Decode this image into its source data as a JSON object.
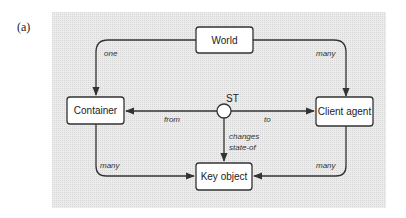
{
  "figure": {
    "label": "(a)",
    "panel_color": "#e6e6e6"
  },
  "nodes": {
    "world": "World",
    "container": "Container",
    "client_agent": "Client agent",
    "key_object": "Key object",
    "st": "ST"
  },
  "edges": {
    "world_container": "one",
    "world_client": "many",
    "st_container": "from",
    "st_client": "to",
    "st_key_line1": "changes",
    "st_key_line2": "state-of",
    "container_key": "many",
    "client_key": "many"
  }
}
